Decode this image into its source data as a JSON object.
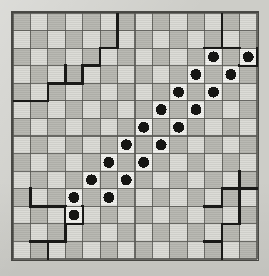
{
  "puzzle": {
    "title": "grid-puzzle-board",
    "type": "checkered-grid-puzzle",
    "columns": 14,
    "rows": 14,
    "cell_size": 17.6,
    "colors": {
      "paper": "#cdcdc8",
      "cell_light": "#dcdcd7",
      "cell_dark": "#b9b9b3",
      "grid_line": "#5a5a56",
      "region_line": "#1a1a18",
      "stone_fill": "#161614",
      "stone_halo": "#f2f2ee"
    },
    "shading_note": "checkerboard: cell is dark when (col+row) is even",
    "shaded_cells": [
      [
        0,
        0
      ],
      [
        2,
        0
      ],
      [
        4,
        0
      ],
      [
        6,
        0
      ],
      [
        8,
        0
      ],
      [
        10,
        0
      ],
      [
        12,
        0
      ],
      [
        1,
        1
      ],
      [
        3,
        1
      ],
      [
        5,
        1
      ],
      [
        7,
        1
      ],
      [
        9,
        1
      ],
      [
        11,
        1
      ],
      [
        13,
        1
      ],
      [
        0,
        2
      ],
      [
        2,
        2
      ],
      [
        4,
        2
      ],
      [
        6,
        2
      ],
      [
        8,
        2
      ],
      [
        10,
        2
      ],
      [
        12,
        2
      ],
      [
        1,
        3
      ],
      [
        3,
        3
      ],
      [
        5,
        3
      ],
      [
        7,
        3
      ],
      [
        9,
        3
      ],
      [
        11,
        3
      ],
      [
        13,
        3
      ],
      [
        0,
        4
      ],
      [
        2,
        4
      ],
      [
        4,
        4
      ],
      [
        6,
        4
      ],
      [
        8,
        4
      ],
      [
        10,
        4
      ],
      [
        12,
        4
      ],
      [
        1,
        5
      ],
      [
        3,
        5
      ],
      [
        5,
        5
      ],
      [
        7,
        5
      ],
      [
        9,
        5
      ],
      [
        11,
        5
      ],
      [
        13,
        5
      ],
      [
        0,
        6
      ],
      [
        2,
        6
      ],
      [
        4,
        6
      ],
      [
        6,
        6
      ],
      [
        8,
        6
      ],
      [
        10,
        6
      ],
      [
        12,
        6
      ],
      [
        1,
        7
      ],
      [
        3,
        7
      ],
      [
        5,
        7
      ],
      [
        7,
        7
      ],
      [
        9,
        7
      ],
      [
        11,
        7
      ],
      [
        13,
        7
      ],
      [
        0,
        8
      ],
      [
        2,
        8
      ],
      [
        4,
        8
      ],
      [
        6,
        8
      ],
      [
        8,
        8
      ],
      [
        10,
        8
      ],
      [
        12,
        8
      ],
      [
        1,
        9
      ],
      [
        3,
        9
      ],
      [
        5,
        9
      ],
      [
        7,
        9
      ],
      [
        9,
        9
      ],
      [
        11,
        9
      ],
      [
        13,
        9
      ],
      [
        0,
        10
      ],
      [
        2,
        10
      ],
      [
        4,
        10
      ],
      [
        6,
        10
      ],
      [
        8,
        10
      ],
      [
        10,
        10
      ],
      [
        12,
        10
      ],
      [
        1,
        11
      ],
      [
        3,
        11
      ],
      [
        5,
        11
      ],
      [
        7,
        11
      ],
      [
        9,
        11
      ],
      [
        11,
        11
      ],
      [
        13,
        11
      ],
      [
        0,
        12
      ],
      [
        2,
        12
      ],
      [
        4,
        12
      ],
      [
        6,
        12
      ],
      [
        8,
        12
      ],
      [
        10,
        12
      ],
      [
        12,
        12
      ],
      [
        1,
        13
      ],
      [
        3,
        13
      ],
      [
        5,
        13
      ],
      [
        7,
        13
      ],
      [
        9,
        13
      ],
      [
        11,
        13
      ],
      [
        13,
        13
      ]
    ],
    "stones": [
      {
        "col": 11,
        "row": 2
      },
      {
        "col": 13,
        "row": 2
      },
      {
        "col": 10,
        "row": 3
      },
      {
        "col": 12,
        "row": 3
      },
      {
        "col": 9,
        "row": 4
      },
      {
        "col": 11,
        "row": 4
      },
      {
        "col": 8,
        "row": 5
      },
      {
        "col": 10,
        "row": 5
      },
      {
        "col": 7,
        "row": 6
      },
      {
        "col": 9,
        "row": 6
      },
      {
        "col": 6,
        "row": 7
      },
      {
        "col": 8,
        "row": 7
      },
      {
        "col": 5,
        "row": 8
      },
      {
        "col": 7,
        "row": 8
      },
      {
        "col": 4,
        "row": 9
      },
      {
        "col": 6,
        "row": 9
      },
      {
        "col": 3,
        "row": 10
      },
      {
        "col": 5,
        "row": 10
      },
      {
        "col": 3,
        "row": 11
      }
    ],
    "stone_count": 19,
    "region_edges": [
      {
        "kind": "h",
        "col": 5,
        "row": 1
      },
      {
        "kind": "h",
        "col": 4,
        "row": 2
      },
      {
        "kind": "h",
        "col": 3,
        "row": 3
      },
      {
        "kind": "h",
        "col": 2,
        "row": 3
      },
      {
        "kind": "h",
        "col": 1,
        "row": 4
      },
      {
        "kind": "h",
        "col": 0,
        "row": 4
      },
      {
        "kind": "v",
        "col": 5,
        "row": 0
      },
      {
        "kind": "v",
        "col": 5,
        "row": 1
      },
      {
        "kind": "v",
        "col": 4,
        "row": 2
      },
      {
        "kind": "v",
        "col": 3,
        "row": 3
      },
      {
        "kind": "v",
        "col": 2,
        "row": 3
      },
      {
        "kind": "v",
        "col": 1,
        "row": 4
      },
      {
        "kind": "h",
        "col": 11,
        "row": 1
      },
      {
        "kind": "h",
        "col": 12,
        "row": 1
      },
      {
        "kind": "h",
        "col": 13,
        "row": 2
      },
      {
        "kind": "v",
        "col": 11,
        "row": 0
      },
      {
        "kind": "v",
        "col": 11,
        "row": 1
      },
      {
        "kind": "v",
        "col": 13,
        "row": 2
      },
      {
        "kind": "h",
        "col": 1,
        "row": 10
      },
      {
        "kind": "h",
        "col": 2,
        "row": 10
      },
      {
        "kind": "h",
        "col": 3,
        "row": 11
      },
      {
        "kind": "h",
        "col": 2,
        "row": 12
      },
      {
        "kind": "h",
        "col": 1,
        "row": 12
      },
      {
        "kind": "v",
        "col": 0,
        "row": 10
      },
      {
        "kind": "v",
        "col": 2,
        "row": 11
      },
      {
        "kind": "v",
        "col": 3,
        "row": 11
      },
      {
        "kind": "v",
        "col": 2,
        "row": 12
      },
      {
        "kind": "v",
        "col": 1,
        "row": 13
      },
      {
        "kind": "h",
        "col": 12,
        "row": 9
      },
      {
        "kind": "h",
        "col": 13,
        "row": 9
      },
      {
        "kind": "h",
        "col": 11,
        "row": 10
      },
      {
        "kind": "h",
        "col": 12,
        "row": 11
      },
      {
        "kind": "h",
        "col": 11,
        "row": 12
      },
      {
        "kind": "v",
        "col": 12,
        "row": 9
      },
      {
        "kind": "v",
        "col": 11,
        "row": 10
      },
      {
        "kind": "v",
        "col": 12,
        "row": 10
      },
      {
        "kind": "v",
        "col": 12,
        "row": 11
      },
      {
        "kind": "v",
        "col": 11,
        "row": 12
      },
      {
        "kind": "v",
        "col": 11,
        "row": 13
      }
    ]
  }
}
